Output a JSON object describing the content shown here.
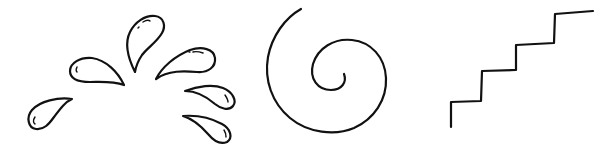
{
  "icons": [
    {
      "name": "splash-drops-icon",
      "description": "water splash with six droplets"
    },
    {
      "name": "spiral-icon",
      "description": "spiral curve"
    },
    {
      "name": "stairs-icon",
      "description": "ascending stair steps line"
    }
  ],
  "colors": {
    "stroke": "#111111",
    "background": "#ffffff"
  }
}
